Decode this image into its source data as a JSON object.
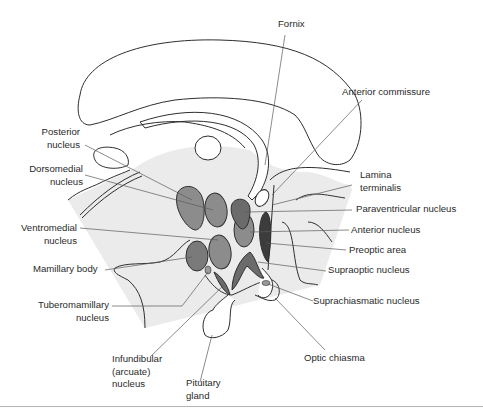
{
  "figure": {
    "colors": {
      "background": "#ffffff",
      "shaded_region": "#ebebeb",
      "outline": "#2e2e2e",
      "leader_line": "#5a5a5a",
      "nucleus_medium": "#8c8c8c",
      "nucleus_dark": "#6b6b6b",
      "preoptic_texture": "#3c3c3c"
    },
    "labels": {
      "fornix": "Fornix",
      "anterior_commissure": "Anterior commissure",
      "posterior_nucleus_1": "Posterior",
      "posterior_nucleus_2": "nucleus",
      "dorsomedial_nucleus_1": "Dorsomedial",
      "dorsomedial_nucleus_2": "nucleus",
      "lamina_terminalis_1": "Lamina",
      "lamina_terminalis_2": "terminalis",
      "paraventricular_nucleus": "Paraventricular nucleus",
      "ventromedial_nucleus_1": "Ventromedial",
      "ventromedial_nucleus_2": "nucleus",
      "anterior_nucleus": "Anterior nucleus",
      "preoptic_area": "Preoptic area",
      "mamillary_body": "Mamillary body",
      "supraoptic_nucleus": "Supraoptic nucleus",
      "tuberomamillary_nucleus_1": "Tuberomamillary",
      "tuberomamillary_nucleus_2": "nucleus",
      "suprachiasmatic_nucleus": "Suprachiasmatic nucleus",
      "infundibular_nucleus_1": "Infundibular",
      "infundibular_nucleus_2": "(arcuate)",
      "infundibular_nucleus_3": "nucleus",
      "optic_chiasma": "Optic chiasma",
      "pituitary_gland_1": "Pituitary",
      "pituitary_gland_2": "gland"
    }
  }
}
